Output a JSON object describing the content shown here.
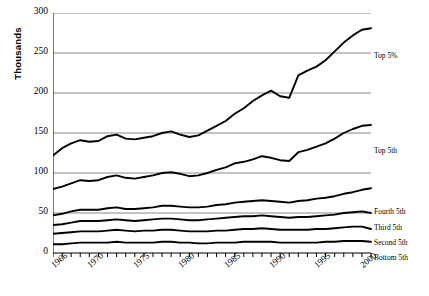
{
  "chart_data": {
    "type": "line",
    "title": "",
    "xlabel": "",
    "ylabel": "Thousands",
    "ylim": [
      0,
      300
    ],
    "yticks": [
      0,
      50,
      100,
      150,
      200,
      250,
      300
    ],
    "xlim": [
      1966,
      2001
    ],
    "xticks": [
      1966,
      1970,
      1975,
      1980,
      1985,
      1990,
      1995,
      2000
    ],
    "xtick_labels": [
      "1966",
      "1970",
      "1975",
      "1980",
      "1985",
      "1990",
      "1995",
      "2000"
    ],
    "grid": "horizontal",
    "legend_position": "right-inline",
    "x": [
      1966,
      1967,
      1968,
      1969,
      1970,
      1971,
      1972,
      1973,
      1974,
      1975,
      1976,
      1977,
      1978,
      1979,
      1980,
      1981,
      1982,
      1983,
      1984,
      1985,
      1986,
      1987,
      1988,
      1989,
      1990,
      1991,
      1992,
      1993,
      1994,
      1995,
      1996,
      1997,
      1998,
      1999,
      2000,
      2001
    ],
    "series": [
      {
        "name": "Top 5%",
        "label": "Top 5%",
        "values": [
          122,
          131,
          137,
          141,
          139,
          140,
          146,
          148,
          143,
          142,
          144,
          146,
          150,
          152,
          148,
          145,
          147,
          153,
          159,
          165,
          174,
          181,
          190,
          197,
          203,
          196,
          194,
          222,
          228,
          233,
          241,
          252,
          263,
          272,
          279,
          281
        ]
      },
      {
        "name": "Top 5th",
        "label": "Top 5th",
        "values": [
          80,
          83,
          87,
          91,
          90,
          91,
          95,
          97,
          94,
          93,
          95,
          97,
          100,
          101,
          99,
          96,
          97,
          100,
          104,
          107,
          112,
          114,
          117,
          121,
          119,
          116,
          115,
          126,
          129,
          133,
          137,
          143,
          150,
          155,
          159,
          160
        ]
      },
      {
        "name": "Fourth 5th",
        "label": "Fourth 5th",
        "values": [
          47,
          49,
          52,
          54,
          54,
          54,
          56,
          57,
          55,
          55,
          56,
          57,
          59,
          59,
          58,
          57,
          57,
          58,
          60,
          61,
          63,
          64,
          65,
          66,
          65,
          64,
          63,
          65,
          66,
          68,
          69,
          71,
          74,
          76,
          79,
          81
        ]
      },
      {
        "name": "Third 5th",
        "label": "Third 5th",
        "values": [
          35,
          36,
          38,
          40,
          40,
          40,
          41,
          42,
          41,
          40,
          41,
          42,
          43,
          43,
          42,
          41,
          41,
          42,
          43,
          44,
          45,
          46,
          46,
          47,
          46,
          45,
          44,
          45,
          45,
          46,
          47,
          48,
          50,
          51,
          52,
          50
        ]
      },
      {
        "name": "Second 5th",
        "label": "Second 5th",
        "values": [
          24,
          25,
          26,
          27,
          27,
          27,
          28,
          29,
          28,
          27,
          28,
          28,
          29,
          29,
          28,
          27,
          27,
          27,
          28,
          28,
          29,
          30,
          30,
          31,
          30,
          29,
          29,
          29,
          29,
          30,
          30,
          31,
          32,
          33,
          33,
          30
        ]
      },
      {
        "name": "Bottom 5th",
        "label": "Bottom 5th",
        "values": [
          11,
          11,
          12,
          13,
          13,
          13,
          13,
          14,
          13,
          13,
          13,
          13,
          14,
          14,
          13,
          13,
          12,
          12,
          13,
          13,
          13,
          14,
          14,
          14,
          14,
          13,
          13,
          13,
          13,
          13,
          14,
          14,
          15,
          15,
          15,
          14
        ]
      }
    ]
  },
  "axis": {
    "y_title": "Thousands"
  },
  "colors": {
    "line": "#000000",
    "grid": "#6b6b6b",
    "axis": "#000000",
    "background": "#ffffff"
  }
}
